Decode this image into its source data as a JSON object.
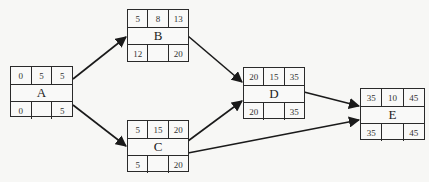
{
  "diagram": {
    "type": "activity-on-node network",
    "nodes": [
      {
        "id": "A",
        "label": "A",
        "es": "0",
        "dur": "5",
        "ef": "5",
        "ls": "0",
        "slack": "",
        "lf": "5"
      },
      {
        "id": "B",
        "label": "B",
        "es": "5",
        "dur": "8",
        "ef": "13",
        "ls": "12",
        "slack": "",
        "lf": "20"
      },
      {
        "id": "C",
        "label": "C",
        "es": "5",
        "dur": "15",
        "ef": "20",
        "ls": "5",
        "slack": "",
        "lf": "20"
      },
      {
        "id": "D",
        "label": "D",
        "es": "20",
        "dur": "15",
        "ef": "35",
        "ls": "20",
        "slack": "",
        "lf": "35"
      },
      {
        "id": "E",
        "label": "E",
        "es": "35",
        "dur": "10",
        "ef": "45",
        "ls": "35",
        "slack": "",
        "lf": "45"
      }
    ],
    "edges": [
      {
        "from": "A",
        "to": "B"
      },
      {
        "from": "A",
        "to": "C"
      },
      {
        "from": "B",
        "to": "D"
      },
      {
        "from": "C",
        "to": "D"
      },
      {
        "from": "C",
        "to": "E"
      },
      {
        "from": "D",
        "to": "E"
      }
    ],
    "colors": {
      "line": "#1a1a1a",
      "background": "#f7f7f5"
    }
  }
}
